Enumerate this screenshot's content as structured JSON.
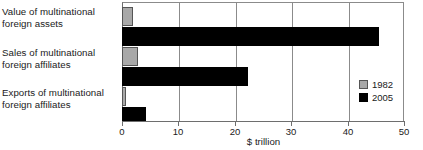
{
  "chart_data": {
    "type": "bar",
    "orientation": "horizontal",
    "title": "",
    "xlabel": "$ trillion",
    "ylabel": "",
    "xlim": [
      0,
      50
    ],
    "xticks": [
      0,
      10,
      20,
      30,
      40,
      50
    ],
    "xtick_labels": [
      "0",
      "10",
      "20",
      "30",
      "40",
      "50"
    ],
    "grid": "vertical",
    "legend_position": "right-inside",
    "categories": [
      "Value of multinational foreign assets",
      "Sales of multinational foreign affiliates",
      "Exports of multinational foreign affiliates"
    ],
    "category_lines": [
      [
        "Value of multinational",
        "foreign assets"
      ],
      [
        "Sales of multinational",
        "foreign affiliates"
      ],
      [
        "Exports of multinational",
        "foreign affiliates"
      ]
    ],
    "series": [
      {
        "name": "1982",
        "color": "#a8a8a8",
        "values": [
          2.0,
          2.8,
          0.7
        ]
      },
      {
        "name": "2005",
        "color": "#000000",
        "values": [
          45.5,
          22.3,
          4.3
        ]
      }
    ]
  },
  "legend": {
    "entries": [
      {
        "label": "1982",
        "swatch": "gray-swatch"
      },
      {
        "label": "2005",
        "swatch": "black-swatch"
      }
    ]
  },
  "axis": {
    "title": "$ trillion",
    "tick_labels": [
      "0",
      "10",
      "20",
      "30",
      "40",
      "50"
    ]
  },
  "colors": {
    "series_1982": "#a8a8a8",
    "series_2005": "#000000",
    "axis": "#6e6e6e",
    "grid": "#8b8b8b",
    "text": "#1a1a1a",
    "background": "#ffffff"
  }
}
